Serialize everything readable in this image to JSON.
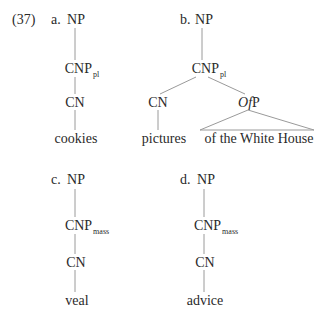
{
  "example_number": "(37)",
  "trees": [
    {
      "letter": "a.",
      "root": "NP",
      "cnp": {
        "base": "CNP",
        "sub": "pl"
      },
      "cn": "CN",
      "leaf": "cookies"
    },
    {
      "letter": "b.",
      "root": "NP",
      "cnp": {
        "base": "CNP",
        "sub": "pl"
      },
      "cn": "CN",
      "cn_leaf": "pictures",
      "ofp": {
        "italic_part": "Of",
        "rest": "P"
      },
      "ofp_leaf": "of the White House"
    },
    {
      "letter": "c.",
      "root": "NP",
      "cnp": {
        "base": "CNP",
        "sub": "mass"
      },
      "cn": "CN",
      "leaf": "veal"
    },
    {
      "letter": "d.",
      "root": "NP",
      "cnp": {
        "base": "CNP",
        "sub": "mass"
      },
      "cn": "CN",
      "leaf": "advice"
    }
  ]
}
